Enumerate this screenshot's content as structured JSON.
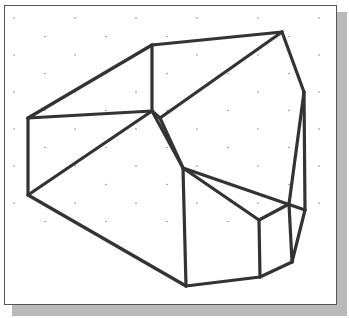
{
  "drawing": {
    "type": "wireframe-solid",
    "stroke_color": "#333333",
    "stroke_width": 3.2,
    "grid_color": "#8a8a8a",
    "frame_border_color": "#555555",
    "shadow_color": "#b9b9b9",
    "vertices": {
      "A": [
        28,
        118
      ],
      "B": [
        152,
        45
      ],
      "C": [
        282,
        32
      ],
      "D": [
        304,
        92
      ],
      "E": [
        305,
        210
      ],
      "F": [
        292,
        262
      ],
      "G": [
        260,
        277
      ],
      "H": [
        186,
        286
      ],
      "I": [
        28,
        195
      ],
      "J": [
        152,
        111
      ],
      "K": [
        160,
        118
      ],
      "L": [
        183,
        168
      ],
      "M": [
        259,
        220
      ],
      "N": [
        289,
        204
      ]
    },
    "edges": [
      [
        "A",
        "B"
      ],
      [
        "B",
        "C"
      ],
      [
        "C",
        "D"
      ],
      [
        "D",
        "E"
      ],
      [
        "E",
        "F"
      ],
      [
        "F",
        "G"
      ],
      [
        "G",
        "H"
      ],
      [
        "H",
        "I"
      ],
      [
        "I",
        "A"
      ],
      [
        "A",
        "J"
      ],
      [
        "B",
        "J"
      ],
      [
        "J",
        "K"
      ],
      [
        "K",
        "C"
      ],
      [
        "J",
        "I"
      ],
      [
        "J",
        "L"
      ],
      [
        "K",
        "L"
      ],
      [
        "L",
        "H"
      ],
      [
        "L",
        "M"
      ],
      [
        "M",
        "G"
      ],
      [
        "M",
        "N"
      ],
      [
        "N",
        "F"
      ],
      [
        "N",
        "D"
      ],
      [
        "L",
        "E"
      ]
    ]
  }
}
